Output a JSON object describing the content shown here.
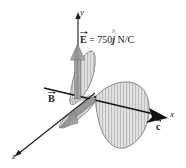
{
  "figure": {
    "kind": "electromagnetic-wave-diagram",
    "width": 186,
    "height": 168,
    "background": "#ffffff"
  },
  "axes": {
    "x": {
      "label": "x",
      "direction": "right-slightly-down"
    },
    "y": {
      "label": "y",
      "direction": "up"
    },
    "z": {
      "label": "z",
      "direction": "lower-left"
    },
    "color": "#1a1a1a"
  },
  "vectors": {
    "e_field": {
      "symbol": "E",
      "accent": "arrow",
      "equation_prefix": "E",
      "equation_rest": " = 750",
      "unit_vector": "j",
      "unit_vector_accent": "^",
      "units": " N/C",
      "full_text": "E = 750j N/C",
      "arrow_color": "#9a9a9a",
      "arrow_outline": "#6e6e6e"
    },
    "b_field": {
      "symbol": "B",
      "accent": "arrow",
      "arrow_color": "#9a9a9a",
      "arrow_outline": "#6e6e6e"
    },
    "c_propagation": {
      "symbol": "c",
      "accent": "arrow",
      "arrow_color": "#111111"
    }
  },
  "waves": {
    "e_wave": {
      "name": "electric-field-wave",
      "plane": "xy",
      "fill": "#dcdcdc",
      "hatch": "#9d9d9d",
      "outline": "#6f6f6f"
    },
    "b_wave": {
      "name": "magnetic-field-wave",
      "plane": "xz",
      "fill": "#d2d2d2",
      "hatch": "#9d9d9d",
      "outline": "#6f6f6f"
    }
  },
  "colors": {
    "ink": "#1a1a1a",
    "gray_fill": "#dcdcdc",
    "gray_line": "#9d9d9d",
    "arrow_gray": "#9a9a9a"
  }
}
